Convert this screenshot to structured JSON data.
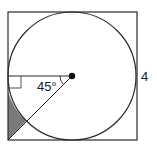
{
  "diagram": {
    "title": "",
    "angle_label": "45°",
    "side_label": "4",
    "colors": {
      "stroke": "#2a2a2a",
      "shaded_region": "#7a7a7a",
      "background": "#ffffff"
    },
    "elements": {
      "square": {
        "side": "4"
      },
      "circle": {
        "inscribed": true
      },
      "center_point": true,
      "radius_to_left": {
        "horizontal": true,
        "right_angle_marker": true
      },
      "diagonal_line": {
        "angle_with_horizontal": "45°",
        "to": "bottom-left corner"
      },
      "shaded_region": "region between circle, left side of square, and diagonal near bottom-left corner"
    }
  }
}
